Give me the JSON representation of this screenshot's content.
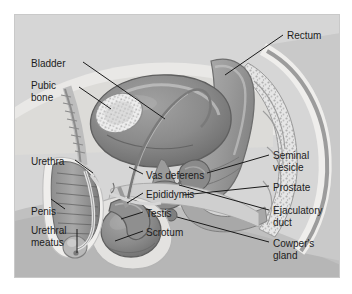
{
  "figure": {
    "frame": {
      "background_color": "#d4d4d4",
      "border_color": "#c9c9c9",
      "outer_background": "#ffffff"
    },
    "palette": {
      "label_text": "#1c1c1c",
      "leader_line": "#1a1a1a",
      "bladder": "#8f8f8f",
      "bladder_dark": "#6f6f6f",
      "rectum": "#a0a0a0",
      "bone_light": "#e8e8e8",
      "bone_mottle": "#b5b5b5",
      "skin": "#f0efed",
      "tissue_mid": "#b9b9b9",
      "tissue_dark": "#7a7a7a",
      "testis": "#8a8a8a",
      "highlight": "#ffffff"
    },
    "labels": [
      {
        "id": "bladder",
        "text": "Bladder",
        "lines": [
          "Bladder"
        ],
        "x": 16,
        "y": 43,
        "align": "left"
      },
      {
        "id": "pubic-bone",
        "text": "Pubic bone",
        "lines": [
          "Pubic",
          "bone"
        ],
        "x": 16,
        "y": 65,
        "align": "left"
      },
      {
        "id": "urethra",
        "text": "Urethra",
        "lines": [
          "Urethra"
        ],
        "x": 16,
        "y": 141,
        "align": "left"
      },
      {
        "id": "penis",
        "text": "Penis",
        "lines": [
          "Penis"
        ],
        "x": 16,
        "y": 191,
        "align": "left"
      },
      {
        "id": "urethral-meatus",
        "text": "Urethral meatus",
        "lines": [
          "Urethral",
          "meatus"
        ],
        "x": 16,
        "y": 210,
        "align": "left"
      },
      {
        "id": "rectum",
        "text": "Rectum",
        "lines": [
          "Rectum"
        ],
        "x": 272,
        "y": 15,
        "align": "left"
      },
      {
        "id": "seminal-vesicle",
        "text": "Seminal vesicle",
        "lines": [
          "Seminal",
          "vesicle"
        ],
        "x": 258,
        "y": 135,
        "align": "left"
      },
      {
        "id": "prostate",
        "text": "Prostate",
        "lines": [
          "Prostate"
        ],
        "x": 258,
        "y": 167,
        "align": "left"
      },
      {
        "id": "ejaculatory-duct",
        "text": "Ejaculatory duct",
        "lines": [
          "Ejaculatory",
          "duct"
        ],
        "x": 258,
        "y": 190,
        "align": "left"
      },
      {
        "id": "cowpers-gland",
        "text": "Cowper's gland",
        "lines": [
          "Cowper's",
          "gland"
        ],
        "x": 258,
        "y": 223,
        "align": "left"
      },
      {
        "id": "vas-deferens",
        "text": "Vas deferens",
        "lines": [
          "Vas deferens"
        ],
        "x": 131,
        "y": 155,
        "align": "left"
      },
      {
        "id": "epididymis",
        "text": "Epididymis",
        "lines": [
          "Epididymis"
        ],
        "x": 131,
        "y": 174,
        "align": "left"
      },
      {
        "id": "testis",
        "text": "Testis",
        "lines": [
          "Testis"
        ],
        "x": 131,
        "y": 193,
        "align": "left"
      },
      {
        "id": "scrotum",
        "text": "Scrotum",
        "lines": [
          "Scrotum"
        ],
        "x": 131,
        "y": 212,
        "align": "left"
      }
    ]
  }
}
